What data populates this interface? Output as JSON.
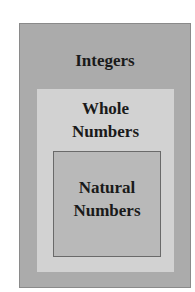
{
  "diagram": {
    "type": "nested-sets",
    "sets": [
      {
        "id": "integers",
        "label": "Integers",
        "color": "#ababab"
      },
      {
        "id": "whole",
        "label_line1": "Whole",
        "label_line2": "Numbers",
        "color": "#d2d2d2"
      },
      {
        "id": "natural",
        "label_line1": "Natural",
        "label_line2": "Numbers",
        "color": "#b9b9b9"
      }
    ]
  }
}
